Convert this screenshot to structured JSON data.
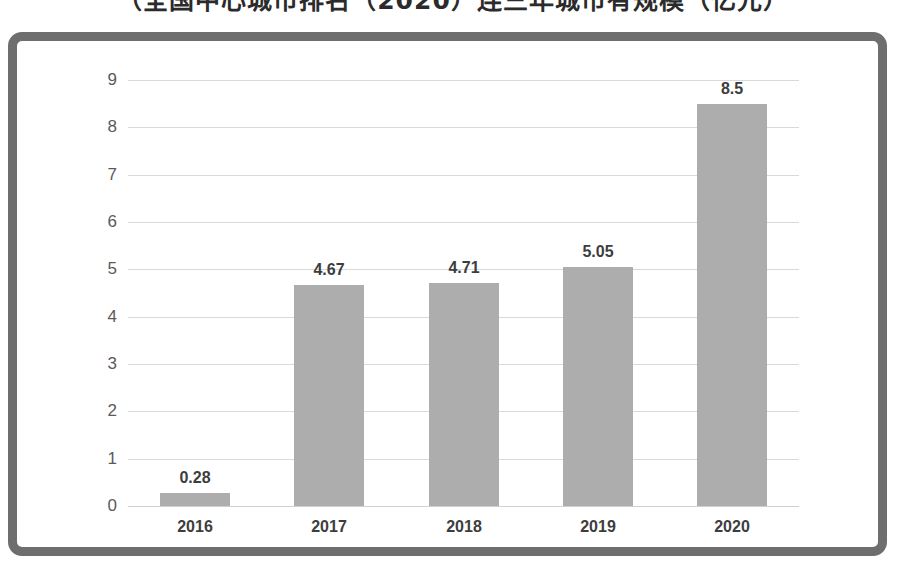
{
  "title": {
    "text": "（全国中心城市排名（2020）连三年城市有规模（亿元）",
    "cut_off": true
  },
  "chart_data": {
    "type": "bar",
    "title": "",
    "xlabel": "",
    "ylabel": "",
    "categories": [
      "2016",
      "2017",
      "2018",
      "2019",
      "2020"
    ],
    "values": [
      0.28,
      4.67,
      4.71,
      5.05,
      8.5
    ],
    "value_labels": [
      "0.28",
      "4.67",
      "4.71",
      "5.05",
      "8.5"
    ],
    "ylim": [
      0,
      9
    ],
    "y_ticks": [
      0,
      1,
      2,
      3,
      4,
      5,
      6,
      7,
      8,
      9
    ],
    "y_tick_labels": [
      "0",
      "1",
      "2",
      "3",
      "4",
      "5",
      "6",
      "7",
      "8",
      "9"
    ],
    "grid": true,
    "grid_axis": "y",
    "legend": false,
    "bar_color": "#adadad",
    "grid_color": "#d9d9d9",
    "label_color": "#3d3d3d",
    "tick_color": "#5a5a5a",
    "frame_color": "#6e6e6e"
  }
}
